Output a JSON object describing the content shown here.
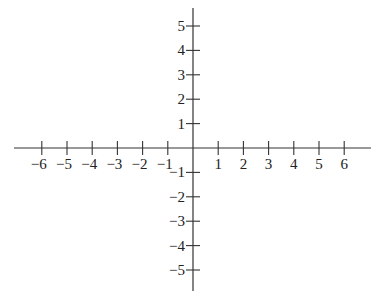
{
  "diagram": {
    "type": "coordinate-plane",
    "axis_color": "#333333",
    "label_color": "#222222",
    "x_axis": {
      "min_tick": -6,
      "max_tick": 6,
      "tick_labels": [
        "-6",
        "-5",
        "-4",
        "-3",
        "-2",
        "-1",
        "1",
        "2",
        "3",
        "4",
        "5",
        "6"
      ]
    },
    "y_axis": {
      "min_tick": -5,
      "max_tick": 5,
      "tick_labels": [
        "5",
        "4",
        "3",
        "2",
        "1",
        "-1",
        "-2",
        "-3",
        "-4",
        "-5"
      ]
    }
  }
}
